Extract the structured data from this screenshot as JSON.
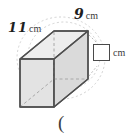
{
  "page": {
    "background_color": "#ffffff",
    "width": 132,
    "height": 136
  },
  "figure": {
    "name": "rectangular-prism",
    "face_fill_front": "#e3e3e3",
    "face_fill_top": "#ededed",
    "face_fill_side": "#d8d8d8",
    "edge_color": "#5a5a5a",
    "hidden_edge_color": "#a8a8a8",
    "erased_arc_color": "#cfcfcf"
  },
  "labels": {
    "depth": {
      "value": "11",
      "unit": "cm"
    },
    "width": {
      "value": "9",
      "unit": "cm"
    },
    "height": {
      "value": "",
      "unit": "cm",
      "placeholder": ""
    }
  },
  "footer": {
    "text": "("
  }
}
